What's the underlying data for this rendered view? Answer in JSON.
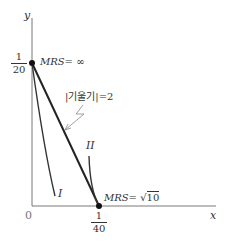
{
  "axes": {
    "x_label": "x",
    "y_label": "y",
    "origin_label": "0"
  },
  "points": {
    "top": {
      "numerator": "1",
      "denominator": "20",
      "label": "MRS= ∞"
    },
    "bottom": {
      "numerator": "1",
      "denominator": "40",
      "label_prefix": "MRS=",
      "label_sqrt": "10"
    }
  },
  "annotations": {
    "slope": "|기울기|=2"
  },
  "curves": {
    "I": "I",
    "II": "II"
  }
}
